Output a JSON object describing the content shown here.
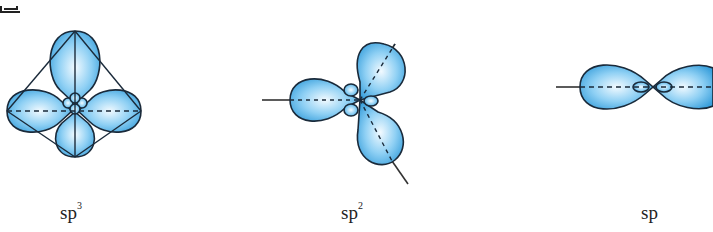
{
  "figure": {
    "panels": [
      {
        "id": "sp3",
        "base": "sp",
        "superscript": "3",
        "label_x": 66
      },
      {
        "id": "sp2",
        "base": "sp",
        "superscript": "2",
        "label_x": 343
      },
      {
        "id": "sp",
        "base": "sp",
        "superscript": "",
        "label_x": 643
      }
    ],
    "colors": {
      "lobe_fill_light": "#e8f6ff",
      "lobe_fill_dark": "#3aa6e0",
      "outline": "#1a2a3a",
      "axis": "#333333"
    }
  }
}
